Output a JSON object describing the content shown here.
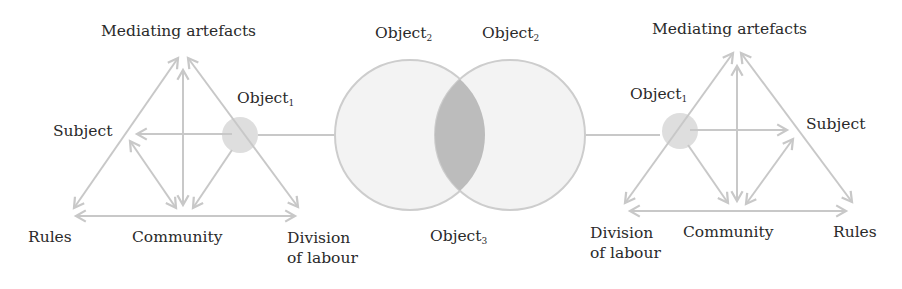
{
  "figure": {
    "colors": {
      "line": "#c8c8c8",
      "circle_fill": "#f3f3f3",
      "circle_stroke": "#cdcdcd",
      "overlap_fill": "#bcbcbc",
      "small_object_fill": "#dedede",
      "text": "#2a2a2a"
    }
  },
  "left_system": {
    "mediating_artefacts": "Mediating artefacts",
    "subject": "Subject",
    "object1": "Object",
    "object1_sub": "1",
    "rules": "Rules",
    "community": "Community",
    "division_line1": "Division",
    "division_line2": "of labour"
  },
  "center": {
    "object2_left": "Object",
    "object2_left_sub": "2",
    "object2_right": "Object",
    "object2_right_sub": "2",
    "object3": "Object",
    "object3_sub": "3"
  },
  "right_system": {
    "mediating_artefacts": "Mediating artefacts",
    "subject": "Subject",
    "object1": "Object",
    "object1_sub": "1",
    "rules": "Rules",
    "community": "Community",
    "division_line1": "Division",
    "division_line2": "of labour"
  }
}
